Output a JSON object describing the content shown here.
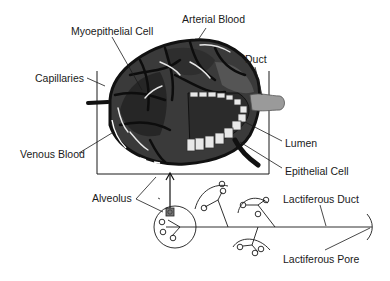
{
  "diagram": {
    "colors": {
      "background": "#ffffff",
      "line": "#1a1a1a",
      "alveolus_fill": "#3a3a3a",
      "alveolus_dark": "#1c1c1c",
      "lumen_fill": "#2b2b2b",
      "duct_fill": "#9a9a9a",
      "cell_fill": "#e8e8e8"
    },
    "labels": {
      "arterial_blood": "Arterial Blood",
      "myoepithelial_cell": "Myoepithelial Cell",
      "duct": "Duct",
      "capillaries": "Capillaries",
      "lumen": "Lumen",
      "venous_blood": "Venous Blood",
      "epithelial_cell": "Epithelial Cell",
      "alveolus": "Alveolus",
      "lactiferous_duct": "Lactiferous Duct",
      "lactiferous_pore": "Lactiferous Pore"
    }
  }
}
